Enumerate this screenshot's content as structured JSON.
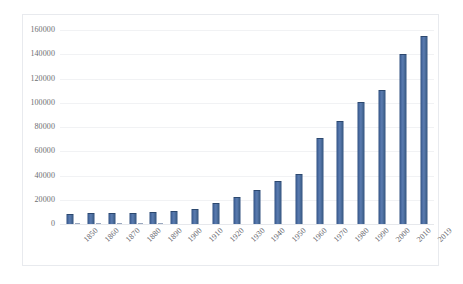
{
  "chart_data": {
    "type": "bar",
    "title": "",
    "subtitle": "",
    "xlabel": "",
    "ylabel": "",
    "grid": true,
    "legend": "none",
    "ylim": [
      0,
      160000
    ],
    "ytick_step": 20000,
    "yticks": [
      "160000",
      "140000",
      "120000",
      "100000",
      "80000",
      "60000",
      "40000",
      "20000",
      "0"
    ],
    "ytick_values": [
      160000,
      140000,
      120000,
      100000,
      80000,
      60000,
      40000,
      20000,
      0
    ],
    "categories": [
      "1850",
      "1860",
      "1870",
      "1880",
      "1890",
      "1900",
      "1910",
      "1920",
      "1930",
      "1940",
      "1950",
      "1960",
      "1970",
      "1980",
      "1990",
      "2000",
      "2010",
      "2019"
    ],
    "values": [
      8500,
      8700,
      8900,
      9200,
      9800,
      11000,
      12500,
      17000,
      22500,
      28000,
      35500,
      41000,
      71000,
      85000,
      101000,
      110500,
      140500,
      155000
    ],
    "series": [
      {
        "name": "Series 1",
        "color": "#4472A8",
        "values": [
          8500,
          8700,
          8900,
          9200,
          9800,
          11000,
          12500,
          17000,
          22500,
          28000,
          35500,
          41000,
          71000,
          85000,
          101000,
          110500,
          140500,
          155000
        ]
      }
    ],
    "annotations": []
  },
  "style": {
    "bar_color": "#4472A8",
    "bar_color_dark": "#2F4F7F",
    "bar_color_light": "#5B7CB0",
    "gridline_color": "#F1F2F4",
    "border_color": "#E8EAEE",
    "axis_text_color": "#63646A",
    "background": "#FFFFFF"
  }
}
